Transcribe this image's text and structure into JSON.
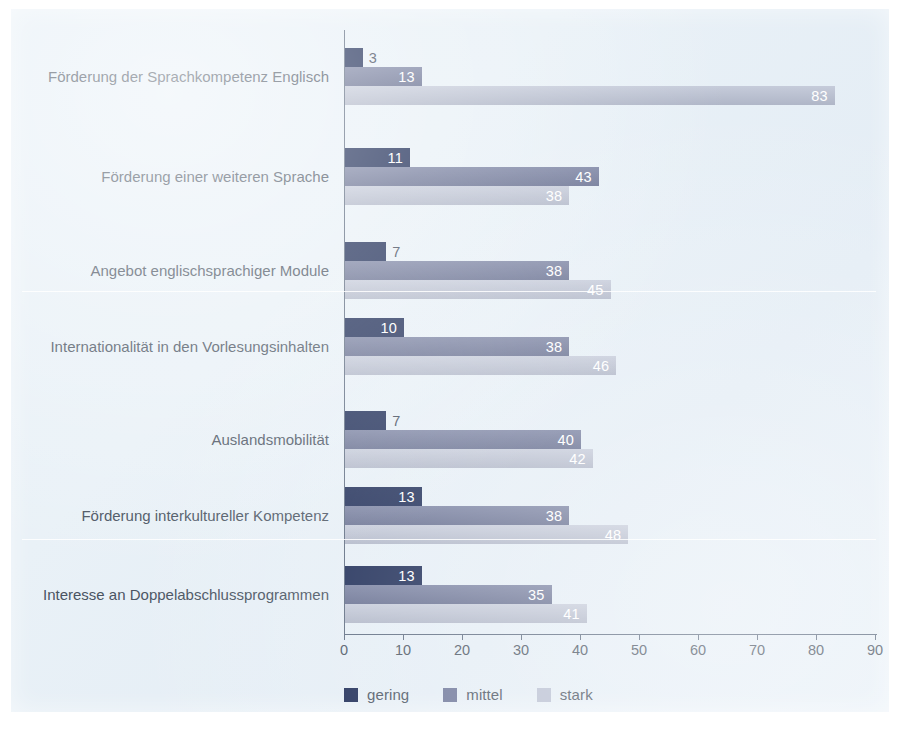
{
  "chart_data": {
    "type": "bar",
    "orientation": "horizontal",
    "grouped": true,
    "title": "",
    "subtitle": "",
    "xlabel": "",
    "ylabel": "",
    "xlim": [
      0,
      90
    ],
    "xticks": [
      0,
      10,
      20,
      30,
      40,
      50,
      60,
      70,
      80,
      90
    ],
    "grid": false,
    "legend_position": "bottom-left",
    "categories": [
      "Förderung der Sprachkompetenz Englisch",
      "Förderung einer weiteren Sprache",
      "Angebot englischsprachiger Module",
      "Internationalität in den Vorlesungsinhalten",
      "Auslandsmobilität",
      "Förderung interkultureller Kompetenz",
      "Interesse an Doppelabschlussprogrammen"
    ],
    "series": [
      {
        "name": "gering",
        "color": "#1b2a55",
        "values": [
          3,
          11,
          7,
          10,
          7,
          13,
          13
        ]
      },
      {
        "name": "mittel",
        "color": "#6d7699",
        "values": [
          13,
          43,
          38,
          38,
          40,
          38,
          35
        ]
      },
      {
        "name": "stark",
        "color": "#b9c0d2",
        "values": [
          83,
          38,
          45,
          46,
          42,
          48,
          41
        ]
      }
    ]
  },
  "legend": {
    "items": [
      {
        "label": "gering",
        "color": "#1b2a55"
      },
      {
        "label": "mittel",
        "color": "#6d7699"
      },
      {
        "label": "stark",
        "color": "#b9c0d2"
      }
    ]
  },
  "axis": {
    "tick_labels": [
      "0",
      "10",
      "20",
      "30",
      "40",
      "50",
      "60",
      "70",
      "80",
      "90"
    ]
  },
  "colors": {
    "panel_background": "#e7f0f7",
    "axis_line": "#5d6b80",
    "label_text": "#4a5462",
    "value_text_inside": "#ffffff",
    "value_text_outside": "#3b4656"
  }
}
